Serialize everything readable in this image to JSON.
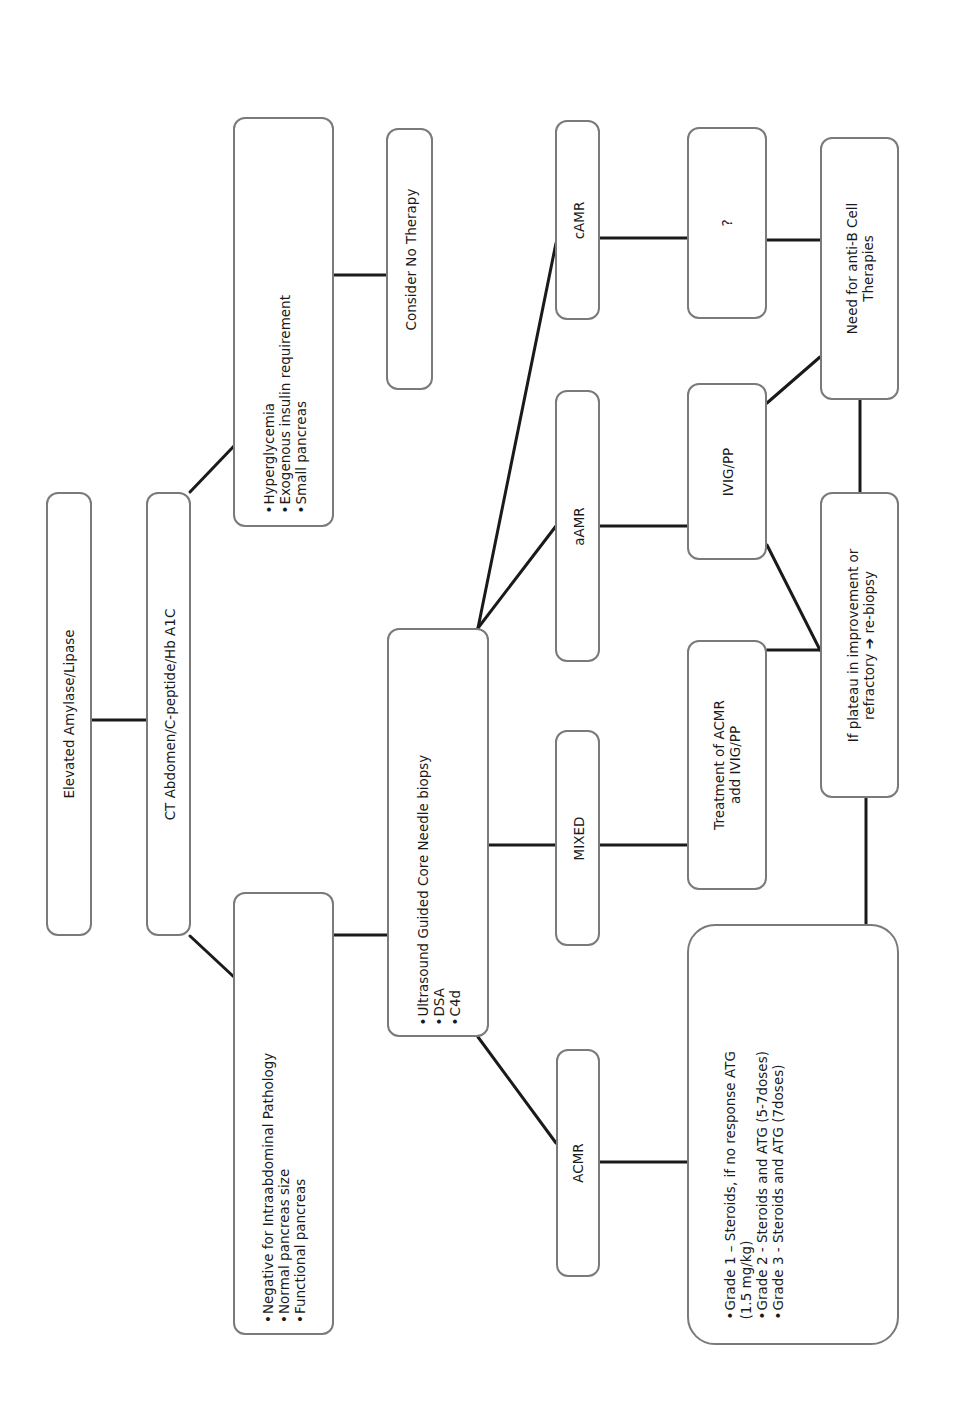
{
  "diagram": {
    "type": "flowchart",
    "orientation": "rotated-90-ccw",
    "line_color": "#1a1a1a",
    "border_color": "#7a7a7a",
    "nodes": {
      "elevated": {
        "lines": [
          "Elevated Amylase/Lipase"
        ]
      },
      "ct": {
        "lines": [
          "CT Abdomen/C-peptide/Hb A1C"
        ]
      },
      "hyper": {
        "lines": [
          "Hyperglycemia",
          "Exogenous insulin requirement",
          "Small pancreas"
        ]
      },
      "no_therapy": {
        "lines": [
          "Consider No Therapy"
        ]
      },
      "negative": {
        "lines": [
          "Negative for Intraabdominal Pathology",
          "Normal pancreas size",
          "Functional pancreas"
        ]
      },
      "ultrasound": {
        "lines": [
          "Ultrasound Guided Core Needle biopsy",
          "DSA",
          "C4d"
        ]
      },
      "camr": {
        "lines": [
          "cAMR"
        ]
      },
      "aamr": {
        "lines": [
          "aAMR"
        ]
      },
      "mixed": {
        "lines": [
          "MIXED"
        ]
      },
      "acmr": {
        "lines": [
          "ACMR"
        ]
      },
      "unknown": {
        "lines": [
          "?"
        ]
      },
      "anti_b": {
        "lines": [
          "Need for anti-B Cell",
          "Therapies"
        ]
      },
      "ivig": {
        "lines": [
          "IVIG/PP"
        ]
      },
      "treatment": {
        "lines": [
          "Treatment of ACMR",
          "add IVIG/PP"
        ]
      },
      "plateau": {
        "lines": [
          "If plateau in improvement or",
          "refractory ➔ re-biopsy"
        ]
      },
      "grades": {
        "lines": [
          "Grade 1 – Steroids, if no response ATG",
          "(1.5 mg/kg)",
          "Grade 2 - Steroids and ATG (5-7doses)",
          "Grade 3 - Steroids and ATG (7doses)"
        ]
      }
    },
    "edges": [
      [
        "elevated",
        "ct"
      ],
      [
        "ct",
        "hyper"
      ],
      [
        "ct",
        "negative"
      ],
      [
        "hyper",
        "no_therapy"
      ],
      [
        "negative",
        "ultrasound"
      ],
      [
        "ultrasound",
        "camr"
      ],
      [
        "ultrasound",
        "aamr"
      ],
      [
        "ultrasound",
        "mixed"
      ],
      [
        "ultrasound",
        "acmr"
      ],
      [
        "camr",
        "unknown"
      ],
      [
        "aamr",
        "ivig"
      ],
      [
        "mixed",
        "treatment"
      ],
      [
        "acmr",
        "grades"
      ],
      [
        "unknown",
        "anti_b"
      ],
      [
        "ivig",
        "anti_b"
      ],
      [
        "ivig",
        "plateau"
      ],
      [
        "treatment",
        "plateau"
      ],
      [
        "plateau",
        "anti_b"
      ],
      [
        "grades",
        "plateau"
      ]
    ]
  }
}
